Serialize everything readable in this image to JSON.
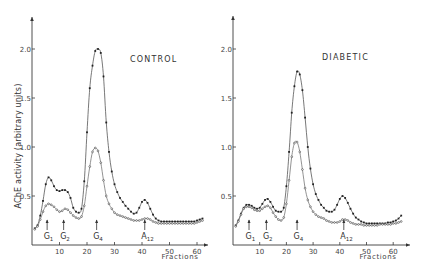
{
  "chart_data": [
    {
      "type": "line",
      "title": "CONTROL",
      "xlabel": "Fractions",
      "ylabel": "AChE activity (arbitrary units)",
      "xlim": [
        0,
        63
      ],
      "ylim": [
        0,
        2.3
      ],
      "xticks": [
        10,
        20,
        30,
        40,
        50,
        60
      ],
      "yticks": [
        0.5,
        1.0,
        1.5,
        2.0
      ],
      "ytick_labels": [
        "0.5",
        "1.0",
        "1.5",
        "2.0"
      ],
      "grid": false,
      "markers": [
        {
          "label": "G",
          "sub": "1",
          "x": 5.5
        },
        {
          "label": "G",
          "sub": "2",
          "x": 11.5
        },
        {
          "label": "G",
          "sub": "4",
          "x": 23.5
        },
        {
          "label": "A",
          "sub": "12",
          "x": 41
        }
      ],
      "series": [
        {
          "name": "upper (filled dots)",
          "style": "upper",
          "x": [
            1,
            2,
            3,
            4,
            5,
            6,
            7,
            8,
            9,
            10,
            11,
            12,
            13,
            14,
            15,
            16,
            17,
            18,
            19,
            20,
            21,
            22,
            23,
            24,
            25,
            26,
            27,
            28,
            29,
            30,
            31,
            32,
            33,
            34,
            35,
            36,
            37,
            38,
            39,
            40,
            41,
            42,
            43,
            44,
            45,
            46,
            47,
            48,
            49,
            50,
            51,
            52,
            53,
            54,
            55,
            56,
            57,
            58,
            59,
            60,
            61,
            62
          ],
          "y": [
            0.17,
            0.2,
            0.3,
            0.45,
            0.62,
            0.69,
            0.66,
            0.6,
            0.56,
            0.55,
            0.56,
            0.56,
            0.54,
            0.48,
            0.38,
            0.34,
            0.33,
            0.37,
            0.65,
            1.15,
            1.6,
            1.83,
            1.98,
            2.0,
            1.96,
            1.72,
            1.25,
            0.95,
            0.75,
            0.62,
            0.54,
            0.48,
            0.44,
            0.4,
            0.37,
            0.34,
            0.32,
            0.33,
            0.38,
            0.44,
            0.46,
            0.43,
            0.37,
            0.31,
            0.27,
            0.25,
            0.24,
            0.24,
            0.24,
            0.24,
            0.24,
            0.24,
            0.24,
            0.24,
            0.24,
            0.24,
            0.24,
            0.24,
            0.24,
            0.25,
            0.26,
            0.27
          ]
        },
        {
          "name": "lower (open dots)",
          "style": "lower",
          "x": [
            1,
            2,
            3,
            4,
            5,
            6,
            7,
            8,
            9,
            10,
            11,
            12,
            13,
            14,
            15,
            16,
            17,
            18,
            19,
            20,
            21,
            22,
            23,
            24,
            25,
            26,
            27,
            28,
            29,
            30,
            31,
            32,
            33,
            34,
            35,
            36,
            37,
            38,
            39,
            40,
            41,
            42,
            43,
            44,
            45,
            46,
            47,
            48,
            49,
            50,
            51,
            52,
            53,
            54,
            55,
            56,
            57,
            58,
            59,
            60,
            61,
            62
          ],
          "y": [
            0.16,
            0.19,
            0.26,
            0.34,
            0.4,
            0.42,
            0.41,
            0.39,
            0.36,
            0.34,
            0.35,
            0.37,
            0.36,
            0.33,
            0.3,
            0.28,
            0.27,
            0.29,
            0.4,
            0.6,
            0.8,
            0.95,
            0.99,
            0.96,
            0.84,
            0.66,
            0.5,
            0.42,
            0.37,
            0.33,
            0.31,
            0.3,
            0.29,
            0.28,
            0.27,
            0.26,
            0.25,
            0.25,
            0.25,
            0.26,
            0.27,
            0.27,
            0.26,
            0.24,
            0.23,
            0.22,
            0.22,
            0.22,
            0.22,
            0.22,
            0.22,
            0.22,
            0.22,
            0.22,
            0.22,
            0.22,
            0.22,
            0.22,
            0.22,
            0.23,
            0.24,
            0.25
          ]
        }
      ]
    },
    {
      "type": "line",
      "title": "DIABETIC",
      "xlabel": "Fractions",
      "ylabel": "",
      "xlim": [
        0,
        63
      ],
      "ylim": [
        0,
        2.3
      ],
      "xticks": [
        10,
        20,
        30,
        40,
        50,
        60
      ],
      "yticks": [
        0.5,
        1.0,
        1.5,
        2.0
      ],
      "ytick_labels": [
        "0.5",
        "1.0",
        "1.5",
        "2.0"
      ],
      "grid": false,
      "markers": [
        {
          "label": "G",
          "sub": "1",
          "x": 6
        },
        {
          "label": "G",
          "sub": "2",
          "x": 12.5
        },
        {
          "label": "G",
          "sub": "4",
          "x": 24
        },
        {
          "label": "A",
          "sub": "12",
          "x": 41.5
        }
      ],
      "series": [
        {
          "name": "upper (filled dots)",
          "style": "upper",
          "x": [
            1,
            2,
            3,
            4,
            5,
            6,
            7,
            8,
            9,
            10,
            11,
            12,
            13,
            14,
            15,
            16,
            17,
            18,
            19,
            20,
            21,
            22,
            23,
            24,
            25,
            26,
            27,
            28,
            29,
            30,
            31,
            32,
            33,
            34,
            35,
            36,
            37,
            38,
            39,
            40,
            41,
            42,
            43,
            44,
            45,
            46,
            47,
            48,
            49,
            50,
            51,
            52,
            53,
            54,
            55,
            56,
            57,
            58,
            59,
            60,
            61,
            62,
            63
          ],
          "y": [
            0.2,
            0.25,
            0.32,
            0.38,
            0.41,
            0.41,
            0.4,
            0.38,
            0.37,
            0.38,
            0.42,
            0.46,
            0.47,
            0.44,
            0.39,
            0.35,
            0.34,
            0.34,
            0.38,
            0.6,
            0.95,
            1.35,
            1.62,
            1.77,
            1.74,
            1.58,
            1.3,
            1.0,
            0.78,
            0.62,
            0.52,
            0.46,
            0.41,
            0.38,
            0.35,
            0.34,
            0.34,
            0.36,
            0.41,
            0.47,
            0.5,
            0.48,
            0.43,
            0.37,
            0.32,
            0.28,
            0.26,
            0.24,
            0.23,
            0.22,
            0.22,
            0.22,
            0.22,
            0.22,
            0.22,
            0.22,
            0.22,
            0.23,
            0.23,
            0.24,
            0.25,
            0.27,
            0.3
          ]
        },
        {
          "name": "lower (open dots)",
          "style": "lower",
          "x": [
            1,
            2,
            3,
            4,
            5,
            6,
            7,
            8,
            9,
            10,
            11,
            12,
            13,
            14,
            15,
            16,
            17,
            18,
            19,
            20,
            21,
            22,
            23,
            24,
            25,
            26,
            27,
            28,
            29,
            30,
            31,
            32,
            33,
            34,
            35,
            36,
            37,
            38,
            39,
            40,
            41,
            42,
            43,
            44,
            45,
            46,
            47,
            48,
            49,
            50,
            51,
            52,
            53,
            54,
            55,
            56,
            57,
            58,
            59,
            60,
            61,
            62,
            63
          ],
          "y": [
            0.19,
            0.24,
            0.31,
            0.37,
            0.39,
            0.39,
            0.38,
            0.36,
            0.35,
            0.35,
            0.37,
            0.39,
            0.4,
            0.38,
            0.33,
            0.29,
            0.26,
            0.25,
            0.28,
            0.42,
            0.66,
            0.9,
            1.04,
            1.05,
            0.95,
            0.77,
            0.58,
            0.46,
            0.39,
            0.34,
            0.31,
            0.29,
            0.28,
            0.27,
            0.25,
            0.24,
            0.23,
            0.23,
            0.23,
            0.24,
            0.26,
            0.26,
            0.25,
            0.23,
            0.22,
            0.21,
            0.21,
            0.21,
            0.2,
            0.2,
            0.2,
            0.2,
            0.2,
            0.2,
            0.21,
            0.21,
            0.21,
            0.21,
            0.21,
            0.22,
            0.22,
            0.23,
            0.24
          ]
        }
      ]
    }
  ],
  "panels": [
    {
      "title": "CONTROL",
      "xlabel": "Fractions",
      "ylabel": "AChE activity (arbitrary units)"
    },
    {
      "title": "DIABETIC",
      "xlabel": "Fractions",
      "ylabel": ""
    }
  ]
}
